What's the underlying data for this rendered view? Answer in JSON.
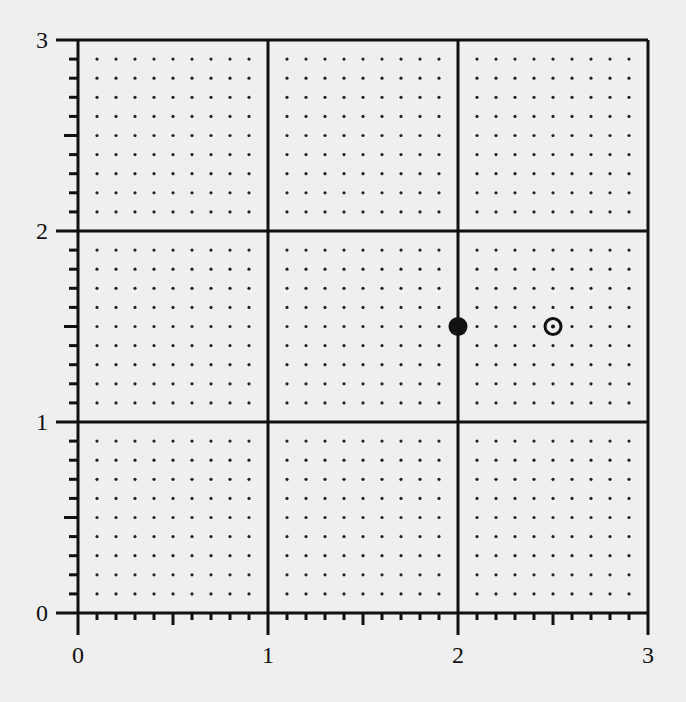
{
  "chart_data": {
    "type": "scatter",
    "title": "",
    "xlabel": "",
    "ylabel": "",
    "xlim": [
      0,
      3
    ],
    "ylim": [
      0,
      3
    ],
    "x_ticks": [
      "0",
      "1",
      "2",
      "3"
    ],
    "y_ticks": [
      "0",
      "1",
      "2",
      "3"
    ],
    "major_grid_step": 1,
    "minor_tick_step": 0.1,
    "dot_grid_step": 0.1,
    "grid": true,
    "legend": null,
    "series": [
      {
        "name": "filled-point",
        "marker": "filled-circle",
        "points": [
          [
            2,
            1.5
          ]
        ]
      },
      {
        "name": "hollow-point",
        "marker": "circled-dot",
        "points": [
          [
            2.5,
            1.5
          ]
        ]
      }
    ]
  },
  "layout": {
    "x0_px": 78,
    "x_unit_px": 190,
    "y0_px": 613,
    "y_unit_px": 191
  },
  "colors": {
    "ink": "#111111",
    "paper": "#efefef",
    "dot": "#222222"
  }
}
